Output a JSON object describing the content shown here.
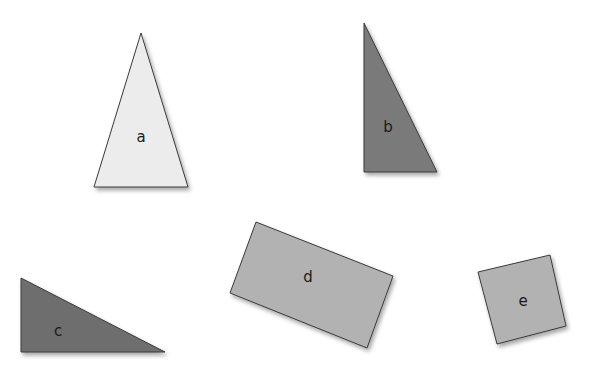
{
  "diagram": {
    "background": "#ffffff",
    "shapes": [
      {
        "id": "a",
        "kind": "isosceles-triangle",
        "label": "a",
        "fill": "#ececec",
        "points": "141,33 94,187 188,187",
        "label_pos": [
          141,
          137
        ]
      },
      {
        "id": "b",
        "kind": "right-triangle",
        "label": "b",
        "fill": "#7a7a7a",
        "points": "364,23 364,172 437,172",
        "label_pos": [
          388,
          127
        ]
      },
      {
        "id": "c",
        "kind": "right-triangle",
        "label": "c",
        "fill": "#6e6e6e",
        "points": "21,278 21,352 165,352",
        "label_pos": [
          58,
          331
        ]
      },
      {
        "id": "d",
        "kind": "rectangle",
        "label": "d",
        "fill": "#b2b2b2",
        "points": "256,222 393,276 367,348 230,293",
        "label_pos": [
          308,
          277
        ]
      },
      {
        "id": "e",
        "kind": "square",
        "label": "e",
        "fill": "#b2b2b2",
        "points": "478,272 550,255 566,326 497,344",
        "label_pos": [
          523,
          301
        ]
      }
    ]
  }
}
